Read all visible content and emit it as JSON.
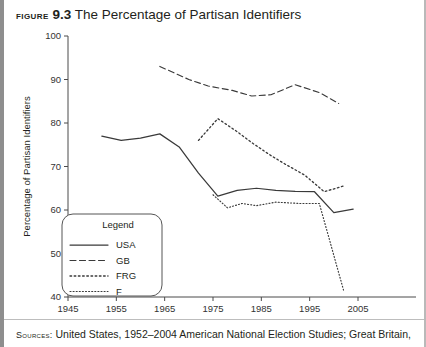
{
  "figure": {
    "label": "Figure",
    "number": "9.3",
    "title_text": "The Percentage of Partisan Identifiers",
    "source_label": "Sources:",
    "source_text": "United States, 1952–2004 American National Election Studies; Great Britain,"
  },
  "chart_data": {
    "type": "line",
    "title": "The Percentage of Partisan Identifiers",
    "xlabel": "",
    "ylabel": "Percentage of Partisan Identifiers",
    "xlim": [
      1945,
      2005
    ],
    "ylim": [
      40,
      100
    ],
    "xticks": [
      1945,
      1955,
      1965,
      1975,
      1985,
      1995,
      2005
    ],
    "yticks": [
      40,
      50,
      60,
      70,
      80,
      90,
      100
    ],
    "grid": false,
    "legend_position": "lower-left-inside",
    "legend_title": "Legend",
    "series": [
      {
        "name": "USA",
        "style": "solid",
        "x": [
          1952,
          1956,
          1960,
          1964,
          1968,
          1972,
          1976,
          1980,
          1984,
          1988,
          1992,
          1996,
          2000,
          2004
        ],
        "values": [
          77.0,
          76.0,
          76.5,
          77.5,
          74.5,
          68.5,
          63.2,
          64.5,
          65.0,
          64.5,
          64.3,
          64.2,
          59.4,
          60.2
        ]
      },
      {
        "name": "GB",
        "style": "dashed",
        "x": [
          1964,
          1966,
          1970,
          1974,
          1979,
          1983,
          1987,
          1992,
          1997,
          2001
        ],
        "values": [
          93.0,
          92.0,
          90.0,
          88.5,
          87.5,
          86.2,
          86.5,
          88.8,
          87.0,
          84.5
        ]
      },
      {
        "name": "FRG",
        "style": "dotted",
        "x": [
          1972,
          1976,
          1980,
          1983,
          1987,
          1990,
          1994,
          1998,
          2002
        ],
        "values": [
          76.0,
          81.0,
          78.0,
          75.5,
          72.5,
          70.5,
          68.0,
          64.2,
          65.5
        ]
      },
      {
        "name": "F",
        "style": "fine-dotted",
        "x": [
          1975,
          1978,
          1981,
          1984,
          1988,
          1993,
          1997,
          2002
        ],
        "values": [
          63.5,
          60.5,
          61.5,
          61.0,
          61.8,
          61.5,
          61.5,
          41.6
        ]
      }
    ]
  }
}
